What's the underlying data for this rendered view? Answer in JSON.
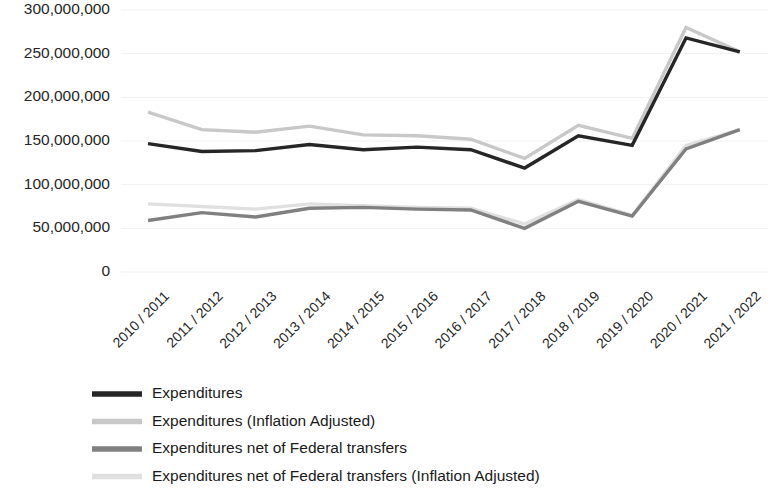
{
  "chart_data": {
    "type": "line",
    "title": "",
    "xlabel": "",
    "ylabel": "",
    "ylim": [
      0,
      300000000
    ],
    "grid": true,
    "legend_position": "bottom-left",
    "categories": [
      "2010 / 2011",
      "2011 / 2012",
      "2012 / 2013",
      "2013 / 2014",
      "2014 / 2015",
      "2015 / 2016",
      "2016 / 2017",
      "2017 / 2018",
      "2018 / 2019",
      "2019 / 2020",
      "2020 / 2021",
      "2021 / 2022"
    ],
    "ytick_labels": [
      "300,000,000",
      "250,000,000",
      "200,000,000",
      "150,000,000",
      "100,000,000",
      "50,000,000",
      "0"
    ],
    "ytick_values": [
      300000000,
      250000000,
      200000000,
      150000000,
      100000000,
      50000000,
      0
    ],
    "series": [
      {
        "name": "Expenditures",
        "color": "#262626",
        "width": 3.4,
        "values": [
          147000000,
          138000000,
          139000000,
          146000000,
          140000000,
          143000000,
          140000000,
          119000000,
          156000000,
          145000000,
          268000000,
          252000000
        ]
      },
      {
        "name": "Expenditures (Inflation Adjusted)",
        "color": "#c8c8c8",
        "width": 3.4,
        "values": [
          183000000,
          163000000,
          160000000,
          167000000,
          157000000,
          156000000,
          152000000,
          130000000,
          168000000,
          153000000,
          280000000,
          252000000
        ]
      },
      {
        "name": "Expenditures net of Federal transfers",
        "color": "#808080",
        "width": 3.4,
        "values": [
          59000000,
          68000000,
          63000000,
          73000000,
          74000000,
          72000000,
          71000000,
          50000000,
          81000000,
          64000000,
          141000000,
          163000000
        ]
      },
      {
        "name": "Expenditures net of Federal transfers (Inflation Adjusted)",
        "color": "#e0e0e0",
        "width": 3.4,
        "values": [
          78000000,
          75000000,
          72000000,
          78000000,
          76000000,
          74000000,
          73000000,
          55000000,
          83000000,
          65000000,
          145000000,
          163000000
        ]
      }
    ]
  },
  "legend": {
    "items": [
      {
        "label": "Expenditures",
        "color": "#262626"
      },
      {
        "label": "Expenditures (Inflation Adjusted)",
        "color": "#c8c8c8"
      },
      {
        "label": "Expenditures net of Federal transfers",
        "color": "#808080"
      },
      {
        "label": "Expenditures net of Federal transfers (Inflation Adjusted)",
        "color": "#e0e0e0"
      }
    ]
  }
}
